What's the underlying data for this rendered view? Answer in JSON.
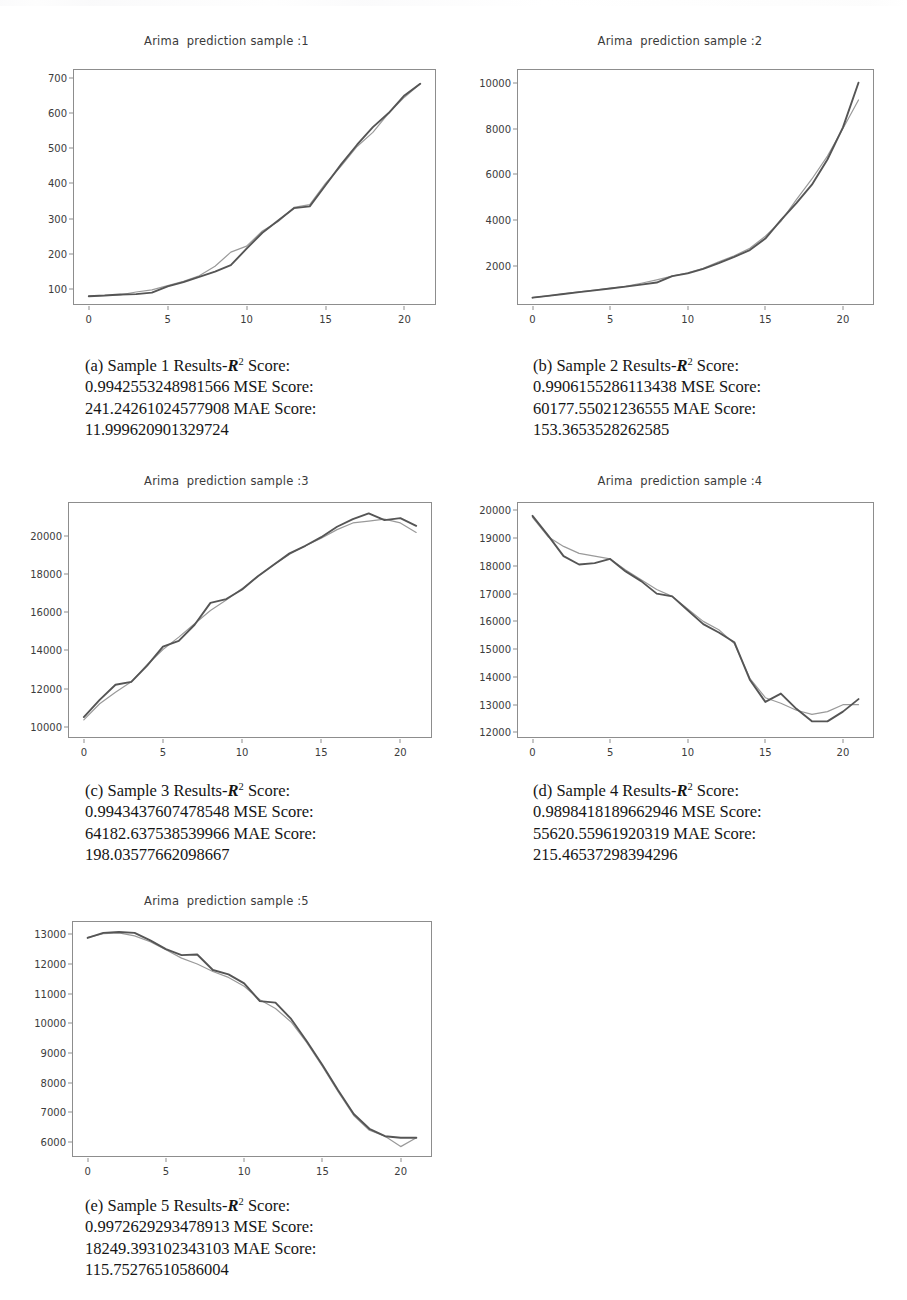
{
  "document": {
    "type": "figure-panel",
    "background": "#ffffff",
    "line_colors": {
      "actual": "#555555",
      "predicted": "#9a9a9a"
    }
  },
  "figures": [
    {
      "id": "fig-a",
      "title": "Arima  prediction sample :1",
      "caption_label": "(a)",
      "caption_prefix": "Sample 1 Results-",
      "caption_r2": "R",
      "caption_sup": "2",
      "caption_body": " Score: 0.9942553248981566 MSE Score: 241.24261024577908 MAE Score: 11.999620901329724"
    },
    {
      "id": "fig-b",
      "title": "Arima  prediction sample :2",
      "caption_label": "(b)",
      "caption_prefix": "Sample 2 Results-",
      "caption_r2": "R",
      "caption_sup": "2",
      "caption_body": " Score: 0.9906155286113438 MSE Score: 60177.55021236555 MAE Score: 153.3653528262585"
    },
    {
      "id": "fig-c",
      "title": "Arima  prediction sample :3",
      "caption_label": "(c)",
      "caption_prefix": "Sample 3 Results-",
      "caption_r2": "R",
      "caption_sup": "2",
      "caption_body": " Score: 0.9943437607478548 MSE Score: 64182.637538539966 MAE Score: 198.03577662098667"
    },
    {
      "id": "fig-d",
      "title": "Arima  prediction sample :4",
      "caption_label": "(d)",
      "caption_prefix": "Sample 4 Results-",
      "caption_r2": "R",
      "caption_sup": "2",
      "caption_body": " Score: 0.9898418189662946 MSE Score: 55620.55961920319 MAE Score: 215.46537298394296"
    },
    {
      "id": "fig-e",
      "title": "Arima  prediction sample :5",
      "caption_label": "(e)",
      "caption_prefix": "Sample 5 Results-",
      "caption_r2": "R",
      "caption_sup": "2",
      "caption_body": " Score: 0.9972629293478913 MSE Score: 18249.393102343103 MAE Score: 115.75276510586004"
    }
  ],
  "chart_data": [
    {
      "id": "fig-a",
      "type": "line",
      "title": "Arima  prediction sample :1",
      "xlabel": "",
      "ylabel": "",
      "xlim": [
        -1,
        22
      ],
      "ylim": [
        55,
        725
      ],
      "xticks": [
        0,
        5,
        10,
        15,
        20
      ],
      "yticks": [
        100,
        200,
        300,
        400,
        500,
        600,
        700
      ],
      "grid": false,
      "legend": "none",
      "x": [
        0,
        1,
        2,
        3,
        4,
        5,
        6,
        7,
        8,
        9,
        10,
        11,
        12,
        13,
        14,
        15,
        16,
        17,
        18,
        19,
        20,
        21
      ],
      "series": [
        {
          "name": "actual",
          "color": "#555555",
          "values": [
            80,
            82,
            85,
            86,
            90,
            108,
            120,
            135,
            150,
            168,
            215,
            260,
            295,
            330,
            335,
            395,
            455,
            510,
            560,
            600,
            650,
            683
          ]
        },
        {
          "name": "predicted",
          "color": "#9a9a9a",
          "values": [
            80,
            82,
            84,
            92,
            98,
            110,
            122,
            138,
            165,
            205,
            222,
            265,
            292,
            332,
            340,
            400,
            450,
            505,
            545,
            600,
            645,
            683
          ]
        }
      ]
    },
    {
      "id": "fig-b",
      "type": "line",
      "title": "Arima  prediction sample :2",
      "xlabel": "",
      "ylabel": "",
      "xlim": [
        -1,
        22
      ],
      "ylim": [
        300,
        10600
      ],
      "xticks": [
        0,
        5,
        10,
        15,
        20
      ],
      "yticks": [
        2000,
        4000,
        6000,
        8000,
        10000
      ],
      "grid": false,
      "legend": "none",
      "x": [
        0,
        1,
        2,
        3,
        4,
        5,
        6,
        7,
        8,
        9,
        10,
        11,
        12,
        13,
        14,
        15,
        16,
        17,
        18,
        19,
        20,
        21
      ],
      "series": [
        {
          "name": "actual",
          "color": "#555555",
          "values": [
            620,
            700,
            780,
            860,
            940,
            1020,
            1100,
            1190,
            1280,
            1560,
            1680,
            1880,
            2130,
            2400,
            2700,
            3200,
            4000,
            4750,
            5550,
            6650,
            8050,
            10000
          ]
        },
        {
          "name": "predicted",
          "color": "#9a9a9a",
          "values": [
            620,
            700,
            790,
            870,
            950,
            1030,
            1110,
            1250,
            1400,
            1560,
            1700,
            1900,
            2180,
            2450,
            2780,
            3300,
            3950,
            4900,
            5800,
            6800,
            8000,
            9250
          ]
        }
      ]
    },
    {
      "id": "fig-c",
      "type": "line",
      "title": "Arima  prediction sample :3",
      "xlabel": "",
      "ylabel": "",
      "xlim": [
        -1,
        22
      ],
      "ylim": [
        9400,
        21800
      ],
      "xticks": [
        0,
        5,
        10,
        15,
        20
      ],
      "yticks": [
        10000,
        12000,
        14000,
        16000,
        18000,
        20000
      ],
      "grid": false,
      "legend": "none",
      "x": [
        0,
        1,
        2,
        3,
        4,
        5,
        6,
        7,
        8,
        9,
        10,
        11,
        12,
        13,
        14,
        15,
        16,
        17,
        18,
        19,
        20,
        21
      ],
      "series": [
        {
          "name": "actual",
          "color": "#555555",
          "values": [
            10500,
            11400,
            12200,
            12350,
            13200,
            14200,
            14500,
            15350,
            16500,
            16700,
            17200,
            17900,
            18500,
            19100,
            19500,
            19950,
            20500,
            20900,
            21200,
            20850,
            20950,
            20550
          ]
        },
        {
          "name": "predicted",
          "color": "#9a9a9a",
          "values": [
            10350,
            11200,
            11800,
            12350,
            13250,
            14050,
            14700,
            15400,
            16100,
            16650,
            17250,
            17900,
            18500,
            19050,
            19500,
            19900,
            20350,
            20700,
            20800,
            20900,
            20700,
            20200
          ]
        }
      ]
    },
    {
      "id": "fig-d",
      "type": "line",
      "title": "Arima  prediction sample :4",
      "xlabel": "",
      "ylabel": "",
      "xlim": [
        -1,
        22
      ],
      "ylim": [
        11800,
        20300
      ],
      "xticks": [
        0,
        5,
        10,
        15,
        20
      ],
      "yticks": [
        12000,
        13000,
        14000,
        15000,
        16000,
        17000,
        18000,
        19000,
        20000
      ],
      "grid": false,
      "legend": "none",
      "x": [
        0,
        1,
        2,
        3,
        4,
        5,
        6,
        7,
        8,
        9,
        10,
        11,
        12,
        13,
        14,
        15,
        16,
        17,
        18,
        19,
        20,
        21
      ],
      "series": [
        {
          "name": "actual",
          "color": "#555555",
          "values": [
            19800,
            19100,
            18350,
            18050,
            18100,
            18250,
            17800,
            17450,
            17000,
            16900,
            16400,
            15900,
            15600,
            15250,
            13900,
            13100,
            13400,
            12850,
            12400,
            12400,
            12750,
            13200
          ]
        },
        {
          "name": "predicted",
          "color": "#9a9a9a",
          "values": [
            19750,
            19050,
            18700,
            18450,
            18350,
            18250,
            17850,
            17500,
            17150,
            16900,
            16450,
            16000,
            15700,
            15200,
            13950,
            13250,
            13050,
            12800,
            12650,
            12750,
            13000,
            13000
          ]
        }
      ]
    },
    {
      "id": "fig-e",
      "type": "line",
      "title": "Arima  prediction sample :5",
      "xlabel": "",
      "ylabel": "",
      "xlim": [
        -1,
        22
      ],
      "ylim": [
        5500,
        13450
      ],
      "xticks": [
        0,
        5,
        10,
        15,
        20
      ],
      "yticks": [
        6000,
        7000,
        8000,
        9000,
        10000,
        11000,
        12000,
        13000
      ],
      "grid": false,
      "legend": "none",
      "x": [
        0,
        1,
        2,
        3,
        4,
        5,
        6,
        7,
        8,
        9,
        10,
        11,
        12,
        13,
        14,
        15,
        16,
        17,
        18,
        19,
        20,
        21
      ],
      "series": [
        {
          "name": "actual",
          "color": "#555555",
          "values": [
            12880,
            13050,
            13080,
            13050,
            12800,
            12500,
            12300,
            12320,
            11800,
            11650,
            11350,
            10750,
            10700,
            10150,
            9400,
            8600,
            7750,
            6950,
            6450,
            6200,
            6150,
            6150
          ]
        },
        {
          "name": "predicted",
          "color": "#9a9a9a",
          "values": [
            12900,
            13020,
            13050,
            12950,
            12750,
            12480,
            12200,
            12000,
            11750,
            11550,
            11250,
            10800,
            10500,
            10050,
            9350,
            8550,
            7700,
            6900,
            6400,
            6200,
            5850,
            6150
          ]
        }
      ]
    }
  ]
}
